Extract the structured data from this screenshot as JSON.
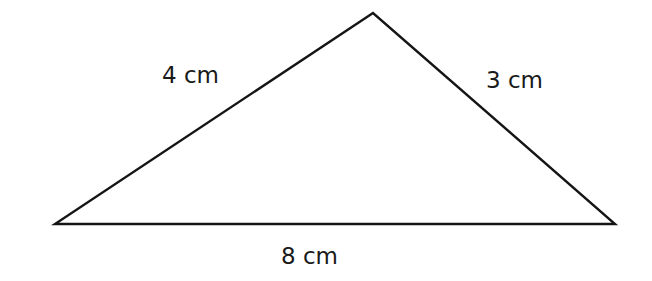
{
  "diagram": {
    "type": "triangle",
    "stroke_color": "#151515",
    "background": "#ffffff",
    "vertices": {
      "top": [
        373,
        13
      ],
      "left": [
        55,
        224
      ],
      "right": [
        615,
        224
      ]
    },
    "sides": [
      {
        "id": "left-side",
        "label": "4 cm",
        "length": 4,
        "unit": "cm"
      },
      {
        "id": "right-side",
        "label": "3 cm",
        "length": 3,
        "unit": "cm"
      },
      {
        "id": "base",
        "label": "8 cm",
        "length": 8,
        "unit": "cm"
      }
    ]
  }
}
